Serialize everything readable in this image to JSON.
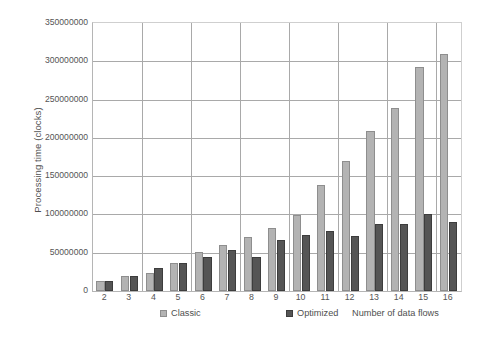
{
  "chart_data": {
    "type": "bar",
    "title": "",
    "xlabel": "Number of data flows",
    "ylabel": "Processing time (clocks)",
    "categories": [
      "2",
      "3",
      "4",
      "5",
      "6",
      "7",
      "8",
      "9",
      "10",
      "11",
      "12",
      "13",
      "14",
      "15",
      "16"
    ],
    "series": [
      {
        "name": "Classic",
        "color": "#b3b3b3",
        "values": [
          13000000,
          19000000,
          23000000,
          37000000,
          51000000,
          60000000,
          70000000,
          82000000,
          99000000,
          139000000,
          170000000,
          209000000,
          239000000,
          292000000,
          310000000
        ]
      },
      {
        "name": "Optimized",
        "color": "#555555",
        "values": [
          13000000,
          20000000,
          30000000,
          37000000,
          45000000,
          54000000,
          45000000,
          66000000,
          73000000,
          78000000,
          72000000,
          88000000,
          87000000,
          100000000,
          90000000
        ]
      }
    ],
    "ylim": [
      0,
      350000000
    ],
    "ytick_values": [
      0,
      50000000,
      100000000,
      150000000,
      200000000,
      250000000,
      300000000,
      350000000
    ],
    "ytick_labels": [
      "0",
      "50000000",
      "100000000",
      "150000000",
      "200000000",
      "250000000",
      "300000000",
      "350000000"
    ],
    "grid": "horizontal-and-vertical",
    "legend_position": "bottom"
  },
  "legend": {
    "entries": [
      {
        "label": "Classic",
        "swatch": "classic-swatch-icon"
      },
      {
        "label": "Optimized",
        "swatch": "optimized-swatch-icon"
      }
    ]
  }
}
